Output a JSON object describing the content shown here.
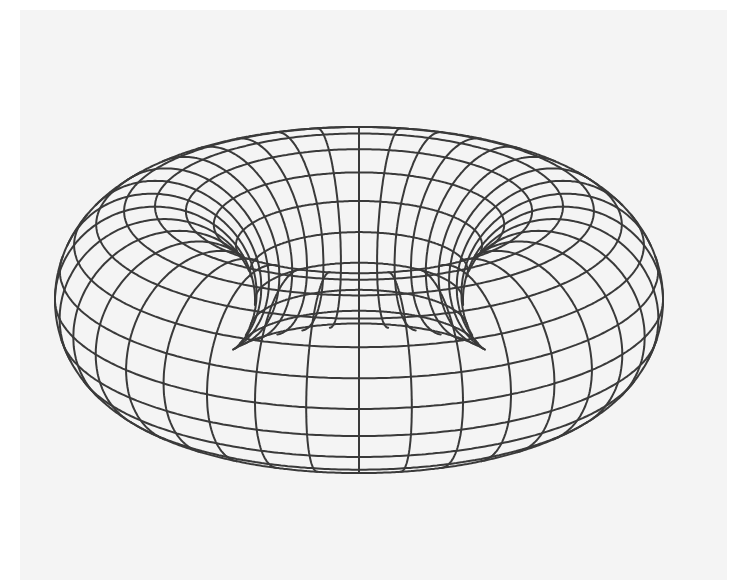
{
  "figure": {
    "background_color": "#ffffff",
    "panel_color": "#f4f4f4",
    "line_color": "#3a3a3a",
    "line_width": 2.0
  },
  "torus": {
    "center_x": 359,
    "center_y": 300,
    "major_radius": 204,
    "minor_radius": 100,
    "tilt_degrees": 21,
    "meridian_count": 36,
    "parallel_count": 20
  }
}
